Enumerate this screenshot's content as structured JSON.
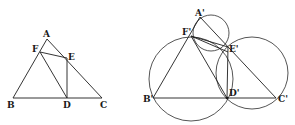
{
  "figure_left": {
    "title": "Triangle ABC with points D, E, F",
    "labels": {
      "A": "A",
      "B": "B",
      "C": "C",
      "D": "D",
      "E": "E",
      "F": "F"
    },
    "points": {
      "A": [
        47,
        39
      ],
      "B": [
        13,
        98
      ],
      "C": [
        102,
        98
      ],
      "D": [
        67,
        98
      ],
      "E": [
        67,
        58
      ],
      "F": [
        40,
        52
      ]
    },
    "segments": [
      [
        "A",
        "B"
      ],
      [
        "A",
        "C"
      ],
      [
        "B",
        "C"
      ],
      [
        "F",
        "E"
      ],
      [
        "F",
        "D"
      ],
      [
        "E",
        "D"
      ]
    ]
  },
  "figure_right": {
    "title": "Triangle A'B'C' with circumcircles through D', E', F'",
    "labels": {
      "A": "A'",
      "B": "B'",
      "C": "C'",
      "D": "D'",
      "E": "E'",
      "F": "F'"
    },
    "points": {
      "A": [
        200,
        17
      ],
      "B": [
        153,
        98
      ],
      "C": [
        276,
        98
      ],
      "D": [
        227,
        98
      ],
      "E": [
        228,
        47
      ],
      "F": [
        191,
        36
      ]
    },
    "segments": [
      [
        "A",
        "B"
      ],
      [
        "A",
        "C"
      ],
      [
        "B",
        "C"
      ],
      [
        "F",
        "E"
      ],
      [
        "F",
        "D"
      ],
      [
        "E",
        "D"
      ]
    ],
    "circles": [
      {
        "name": "circle-AFE",
        "cx": 211,
        "cy": 33,
        "r": 18
      },
      {
        "name": "circle-BFD",
        "cx": 191,
        "cy": 79,
        "r": 42
      },
      {
        "name": "circle-CDE",
        "cx": 252,
        "cy": 73,
        "r": 36
      }
    ]
  }
}
